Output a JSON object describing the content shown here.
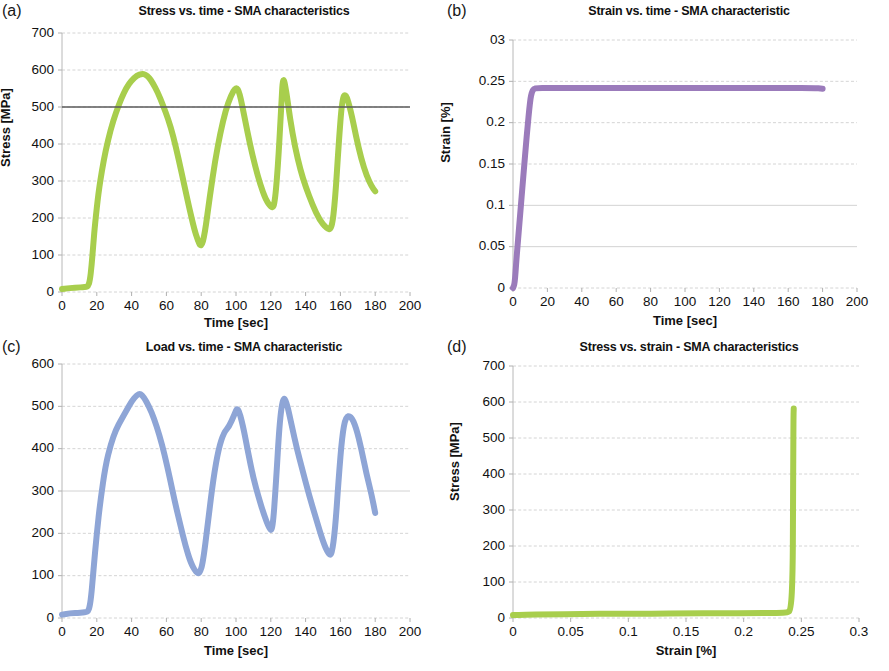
{
  "figure": {
    "background": "#ffffff",
    "panels": [
      "a",
      "b",
      "c",
      "d"
    ]
  },
  "panel_a": {
    "letter": "(a)",
    "title": "Stress vs. time - SMA characteristics",
    "xlabel": "Time [sec]",
    "ylabel": "Stress [MPa]",
    "color": "#a8ce4d",
    "reference_line_label": "500"
  },
  "panel_b": {
    "letter": "(b)",
    "title": "Strain vs. time - SMA characteristic",
    "xlabel": "Time [sec]",
    "ylabel": "Strain [%]",
    "color": "#9b7bbb"
  },
  "panel_c": {
    "letter": "(c)",
    "title": "Load vs. time - SMA characteristic",
    "xlabel": "Time [sec]",
    "ylabel": "Load [N]",
    "color": "#8ea5d6"
  },
  "panel_d": {
    "letter": "(d)",
    "title": "Stress vs. strain - SMA characteristics",
    "xlabel": "Strain [%]",
    "ylabel": "Stress [MPa]",
    "color": "#a8ce4d"
  },
  "chart_data": [
    {
      "panel": "a",
      "type": "line",
      "title": "Stress vs. time - SMA characteristics",
      "xlabel": "Time [sec]",
      "ylabel": "Stress [MPa]",
      "xlim": [
        0,
        200
      ],
      "ylim": [
        0,
        700
      ],
      "xticks": [
        0,
        20,
        40,
        60,
        80,
        100,
        120,
        140,
        160,
        180,
        200
      ],
      "xtick_labels": [
        "0",
        "20",
        "40",
        "60",
        "80",
        "100",
        "120",
        "140",
        "160",
        "180",
        "200"
      ],
      "yticks": [
        0,
        100,
        200,
        300,
        400,
        500,
        600,
        700
      ],
      "ytick_labels": [
        "0",
        "100",
        "200",
        "300",
        "400",
        "500",
        "600",
        "700"
      ],
      "grid": true,
      "legend": null,
      "series": [
        {
          "name": "Stress",
          "color": "#a8ce4d",
          "linewidth": 6,
          "x": [
            0,
            3,
            6,
            9,
            12,
            14,
            15,
            16,
            17,
            18,
            19,
            21,
            23,
            25,
            28,
            31,
            34,
            37,
            40,
            43,
            46,
            48,
            50,
            52,
            55,
            58,
            61,
            64,
            67,
            70,
            73,
            76,
            78,
            80,
            82,
            85,
            88,
            91,
            94,
            97,
            100,
            102,
            105,
            108,
            111,
            114,
            117,
            120,
            122,
            124,
            126,
            127,
            129,
            131,
            134,
            137,
            140,
            144,
            148,
            152,
            155,
            157,
            159,
            161,
            163,
            166,
            169,
            172,
            175,
            178,
            180
          ],
          "y": [
            8,
            10,
            11,
            12,
            13,
            14,
            16,
            30,
            70,
            130,
            185,
            270,
            330,
            380,
            440,
            485,
            522,
            552,
            572,
            585,
            590,
            588,
            580,
            566,
            540,
            505,
            468,
            420,
            360,
            295,
            230,
            170,
            140,
            120,
            155,
            260,
            355,
            430,
            490,
            530,
            555,
            540,
            470,
            400,
            340,
            290,
            250,
            230,
            228,
            330,
            500,
            588,
            540,
            470,
            390,
            330,
            285,
            235,
            195,
            172,
            168,
            250,
            400,
            522,
            538,
            490,
            420,
            360,
            315,
            285,
            272
          ]
        },
        {
          "name": "Reference level 500 MPa",
          "color": "#5a5a5a",
          "linewidth": 1.4,
          "x": [
            0,
            200
          ],
          "y": [
            500,
            500
          ]
        }
      ]
    },
    {
      "panel": "b",
      "type": "line",
      "title": "Strain vs. time - SMA characteristic",
      "xlabel": "Time [sec]",
      "ylabel": "Strain [%]",
      "xlim": [
        0,
        200
      ],
      "ylim": [
        0,
        0.3
      ],
      "xticks": [
        0,
        20,
        40,
        60,
        80,
        100,
        120,
        140,
        160,
        180,
        200
      ],
      "xtick_labels": [
        "0",
        "20",
        "40",
        "60",
        "80",
        "100",
        "120",
        "140",
        "160",
        "180",
        "200"
      ],
      "yticks": [
        0,
        0.05,
        0.1,
        0.15,
        0.2,
        0.25,
        0.3
      ],
      "ytick_labels": [
        "0",
        "0.05",
        "0.1",
        "0.15",
        "0.2",
        "0.25",
        "03"
      ],
      "grid": true,
      "legend": null,
      "series": [
        {
          "name": "Strain",
          "color": "#9b7bbb",
          "linewidth": 6,
          "x": [
            0,
            1,
            2,
            4,
            6,
            8,
            10,
            11,
            12,
            14,
            20,
            40,
            60,
            80,
            100,
            120,
            140,
            160,
            175,
            180
          ],
          "y": [
            0.0,
            0.005,
            0.035,
            0.085,
            0.135,
            0.185,
            0.228,
            0.237,
            0.241,
            0.242,
            0.242,
            0.242,
            0.242,
            0.242,
            0.242,
            0.242,
            0.242,
            0.242,
            0.242,
            0.241
          ]
        }
      ]
    },
    {
      "panel": "c",
      "type": "line",
      "title": "Load vs. time - SMA characteristic",
      "xlabel": "Time [sec]",
      "ylabel": "Load [N]",
      "xlim": [
        0,
        200
      ],
      "ylim": [
        0,
        600
      ],
      "xticks": [
        0,
        20,
        40,
        60,
        80,
        100,
        120,
        140,
        160,
        180,
        200
      ],
      "xtick_labels": [
        "0",
        "20",
        "40",
        "60",
        "80",
        "100",
        "120",
        "140",
        "160",
        "180",
        "200"
      ],
      "yticks": [
        0,
        100,
        200,
        300,
        400,
        500,
        600
      ],
      "ytick_labels": [
        "0",
        "100",
        "200",
        "300",
        "400",
        "500",
        "600"
      ],
      "grid": true,
      "legend": null,
      "series": [
        {
          "name": "Load",
          "color": "#8ea5d6",
          "linewidth": 6,
          "x": [
            0,
            3,
            6,
            9,
            12,
            14,
            15,
            16,
            17,
            18,
            20,
            22,
            25,
            28,
            31,
            34,
            37,
            40,
            43,
            45,
            47,
            50,
            53,
            56,
            59,
            62,
            65,
            68,
            71,
            74,
            77,
            79,
            81,
            84,
            87,
            90,
            93,
            96,
            99,
            101,
            104,
            107,
            110,
            113,
            116,
            119,
            121,
            123,
            125,
            127,
            129,
            132,
            135,
            138,
            142,
            146,
            150,
            153,
            155,
            157,
            159,
            161,
            163,
            166,
            169,
            172,
            175,
            178,
            180
          ],
          "y": [
            8,
            10,
            12,
            12,
            13,
            14,
            16,
            28,
            60,
            110,
            200,
            275,
            360,
            410,
            445,
            468,
            490,
            512,
            527,
            530,
            522,
            500,
            470,
            432,
            385,
            330,
            272,
            220,
            170,
            130,
            108,
            104,
            130,
            230,
            330,
            400,
            438,
            452,
            480,
            500,
            455,
            390,
            330,
            285,
            245,
            212,
            205,
            320,
            460,
            522,
            512,
            455,
            400,
            352,
            290,
            235,
            180,
            152,
            148,
            210,
            330,
            430,
            475,
            478,
            450,
            400,
            340,
            290,
            248
          ]
        }
      ]
    },
    {
      "panel": "d",
      "type": "line",
      "title": "Stress vs. strain - SMA characteristics",
      "xlabel": "Strain [%]",
      "ylabel": "Stress [MPa]",
      "xlim": [
        0,
        0.3
      ],
      "ylim": [
        0,
        700
      ],
      "xticks": [
        0,
        0.05,
        0.1,
        0.15,
        0.2,
        0.25,
        0.3
      ],
      "xtick_labels": [
        "0",
        "0.05",
        "0.1",
        "0.15",
        "0.2",
        "0.25",
        "0.3"
      ],
      "yticks": [
        0,
        100,
        200,
        300,
        400,
        500,
        600,
        700
      ],
      "ytick_labels": [
        "0",
        "100",
        "200",
        "300",
        "400",
        "500",
        "600",
        "700"
      ],
      "grid": true,
      "legend": null,
      "series": [
        {
          "name": "Stress-strain",
          "color": "#a8ce4d",
          "linewidth": 6,
          "x": [
            0.0,
            0.01,
            0.03,
            0.06,
            0.09,
            0.12,
            0.15,
            0.18,
            0.21,
            0.23,
            0.238,
            0.241,
            0.2425,
            0.2428,
            0.243,
            0.2432,
            0.2434
          ],
          "y": [
            8,
            9,
            10,
            11,
            12,
            12,
            13,
            13,
            14,
            14,
            15,
            22,
            120,
            300,
            450,
            560,
            582
          ]
        }
      ]
    }
  ]
}
